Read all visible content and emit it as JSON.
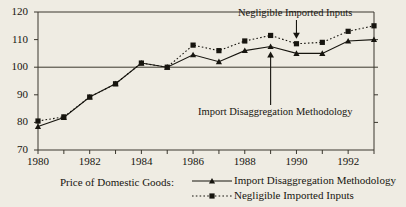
{
  "chart_data": {
    "type": "line",
    "title": "",
    "xlabel": "",
    "ylabel": "",
    "xlim": [
      1980,
      1993
    ],
    "ylim": [
      70,
      120
    ],
    "yticks": [
      70,
      80,
      90,
      100,
      110,
      120
    ],
    "xticks": [
      1980,
      1981,
      1982,
      1983,
      1984,
      1985,
      1986,
      1987,
      1988,
      1989,
      1990,
      1991,
      1992,
      1993
    ],
    "xtick_labels": [
      "1980",
      "",
      "1982",
      "",
      "1984",
      "",
      "1986",
      "",
      "1988",
      "",
      "1990",
      "",
      "1992",
      ""
    ],
    "grid": false,
    "reference_line": 100,
    "legend_position": "bottom-right",
    "x": [
      1980,
      1981,
      1982,
      1983,
      1984,
      1985,
      1986,
      1987,
      1988,
      1989,
      1990,
      1991,
      1992,
      1993
    ],
    "series": [
      {
        "name": "Import Disaggregation Methodology",
        "marker": "triangle",
        "linestyle": "solid",
        "values": [
          78.5,
          81.8,
          89.2,
          94.0,
          101.5,
          100.0,
          104.5,
          102.0,
          106.0,
          107.5,
          105.0,
          105.0,
          109.5,
          110.0
        ]
      },
      {
        "name": "Negligible Imported Inputs",
        "marker": "square",
        "linestyle": "dotted",
        "values": [
          80.5,
          82.0,
          89.2,
          94.0,
          101.5,
          100.0,
          108.0,
          106.0,
          109.5,
          111.5,
          108.5,
          109.0,
          113.0,
          115.0
        ]
      }
    ],
    "annotations": [
      {
        "text": "Negligible Imported Inputs",
        "points_to_year": 1990,
        "points_to_value": 108.5
      },
      {
        "text": "Import Disaggregation Methodology",
        "points_to_year": 1989,
        "points_to_value": 107.5
      }
    ]
  },
  "legend": {
    "title": "Price of Domestic Goods:",
    "entries": [
      {
        "label": "Import Disaggregation Methodology"
      },
      {
        "label": "Negligible Imported Inputs"
      }
    ]
  },
  "colors": {
    "ink": "#17150f",
    "background": "#efece3",
    "axis": "#3a372e"
  }
}
